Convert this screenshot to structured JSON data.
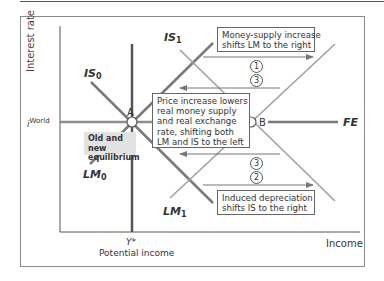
{
  "axes": {
    "y_label": "Interest rate",
    "x_label": "Income",
    "i_world_symbol": "i",
    "i_world_sup": "World",
    "y_star": "Y*",
    "potential_income": "Potential income"
  },
  "curves": {
    "is0": {
      "name": "IS",
      "sub": "0"
    },
    "is1": {
      "name": "IS",
      "sub": "1"
    },
    "lm0": {
      "name": "LM",
      "sub": "0"
    },
    "lm1": {
      "name": "LM",
      "sub": "1"
    },
    "fe": "FE"
  },
  "points": {
    "a": "A",
    "b": "B"
  },
  "annotations": {
    "money_supply": [
      "Money-supply increase",
      "shifts LM to the right"
    ],
    "price_increase": [
      "Price increase lowers",
      "real money supply",
      "and real exchange",
      "rate, shifting both",
      "LM and IS to the left"
    ],
    "depreciation": [
      "Induced depreciation",
      "shifts IS to the right"
    ],
    "equilibrium": [
      "Old and new",
      "equilibrium"
    ]
  },
  "steps": {
    "upper_first": "1",
    "upper_second": "3",
    "lower_first": "3",
    "lower_second": "2"
  },
  "colors": {
    "curve_gray": "#8c8c8c",
    "curve_dark": "#5a5a5a",
    "axis": "#555555",
    "eq_box": "#e2e2e2"
  }
}
